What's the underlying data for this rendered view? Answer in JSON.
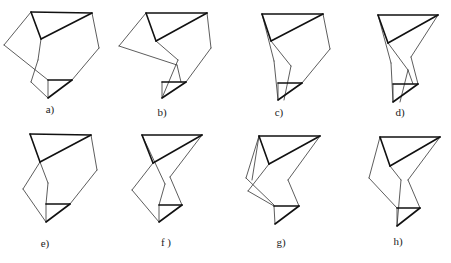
{
  "figure": {
    "panels": [
      {
        "id": "a",
        "label": "a)",
        "label_pos": [
          50,
          111
        ],
        "thick": [
          [
            31,
            12,
            92,
            13
          ],
          [
            31,
            12,
            41,
            39
          ],
          [
            41,
            39,
            92,
            13
          ],
          [
            48,
            80,
            72,
            80
          ],
          [
            48,
            98,
            72,
            80
          ]
        ],
        "thin": [
          [
            92,
            13,
            99,
            48
          ],
          [
            99,
            48,
            72,
            80
          ],
          [
            31,
            12,
            4,
            45
          ],
          [
            4,
            45,
            48,
            80
          ],
          [
            41,
            39,
            38,
            60
          ],
          [
            38,
            60,
            31,
            82
          ],
          [
            31,
            82,
            48,
            98
          ],
          [
            48,
            80,
            48,
            98
          ]
        ]
      },
      {
        "id": "b",
        "label": "b)",
        "label_pos": [
          162,
          114
        ],
        "thick": [
          [
            146,
            13,
            207,
            13
          ],
          [
            146,
            13,
            156,
            41
          ],
          [
            156,
            41,
            207,
            13
          ],
          [
            162,
            82,
            186,
            82
          ],
          [
            162,
            98,
            186,
            82
          ]
        ],
        "thin": [
          [
            207,
            13,
            211,
            48
          ],
          [
            211,
            48,
            186,
            82
          ],
          [
            146,
            13,
            119,
            46
          ],
          [
            119,
            46,
            177,
            65
          ],
          [
            156,
            41,
            178,
            60
          ],
          [
            178,
            60,
            162,
            98
          ],
          [
            162,
            82,
            162,
            98
          ],
          [
            177,
            65,
            181,
            82
          ]
        ]
      },
      {
        "id": "c",
        "label": "c)",
        "label_pos": [
          279,
          114
        ],
        "thick": [
          [
            262,
            14,
            323,
            14
          ],
          [
            262,
            14,
            271,
            41
          ],
          [
            271,
            41,
            323,
            14
          ],
          [
            278,
            83,
            302,
            83
          ],
          [
            278,
            100,
            302,
            83
          ]
        ],
        "thin": [
          [
            323,
            14,
            330,
            49
          ],
          [
            330,
            49,
            302,
            83
          ],
          [
            262,
            14,
            274,
            61
          ],
          [
            274,
            61,
            278,
            100
          ],
          [
            271,
            41,
            291,
            66
          ],
          [
            291,
            66,
            284,
            100
          ],
          [
            278,
            83,
            278,
            100
          ]
        ]
      },
      {
        "id": "d",
        "label": "d)",
        "label_pos": [
          400,
          114
        ],
        "thick": [
          [
            378,
            15,
            438,
            15
          ],
          [
            378,
            15,
            388,
            43
          ],
          [
            388,
            43,
            438,
            15
          ],
          [
            393,
            84,
            418,
            84
          ],
          [
            393,
            102,
            418,
            84
          ]
        ],
        "thin": [
          [
            438,
            15,
            411,
            57
          ],
          [
            411,
            57,
            418,
            84
          ],
          [
            378,
            15,
            391,
            63
          ],
          [
            391,
            63,
            393,
            102
          ],
          [
            388,
            43,
            408,
            70
          ],
          [
            408,
            70,
            400,
            102
          ],
          [
            393,
            84,
            393,
            102
          ],
          [
            408,
            70,
            413,
            84
          ]
        ]
      },
      {
        "id": "e",
        "label": "e)",
        "label_pos": [
          45,
          245
        ],
        "thick": [
          [
            30,
            134,
            91,
            135
          ],
          [
            30,
            134,
            40,
            162
          ],
          [
            40,
            162,
            91,
            135
          ],
          [
            46,
            204,
            70,
            204
          ],
          [
            46,
            222,
            70,
            204
          ]
        ],
        "thin": [
          [
            91,
            135,
            97,
            170
          ],
          [
            97,
            170,
            70,
            204
          ],
          [
            40,
            162,
            23,
            189
          ],
          [
            23,
            189,
            46,
            222
          ],
          [
            40,
            162,
            48,
            183
          ],
          [
            48,
            183,
            46,
            204
          ],
          [
            46,
            204,
            46,
            222
          ]
        ]
      },
      {
        "id": "f",
        "label": "f )",
        "label_pos": [
          166,
          244
        ],
        "thick": [
          [
            142,
            135,
            202,
            135
          ],
          [
            142,
            135,
            153,
            163
          ],
          [
            153,
            163,
            202,
            135
          ],
          [
            159,
            205,
            182,
            205
          ],
          [
            159,
            222,
            182,
            205
          ]
        ],
        "thin": [
          [
            202,
            135,
            170,
            177
          ],
          [
            170,
            177,
            182,
            205
          ],
          [
            153,
            163,
            132,
            190
          ],
          [
            132,
            190,
            159,
            222
          ],
          [
            142,
            135,
            165,
            184
          ],
          [
            165,
            184,
            159,
            205
          ],
          [
            159,
            205,
            159,
            222
          ]
        ]
      },
      {
        "id": "g",
        "label": "g)",
        "label_pos": [
          281,
          244
        ],
        "thick": [
          [
            259,
            136,
            320,
            136
          ],
          [
            259,
            136,
            269,
            164
          ],
          [
            269,
            164,
            320,
            136
          ],
          [
            274,
            206,
            299,
            206
          ],
          [
            275,
            224,
            299,
            206
          ]
        ],
        "thin": [
          [
            320,
            136,
            288,
            180
          ],
          [
            288,
            180,
            299,
            206
          ],
          [
            259,
            136,
            246,
            178
          ],
          [
            246,
            178,
            274,
            205
          ],
          [
            269,
            164,
            248,
            191
          ],
          [
            248,
            191,
            274,
            206
          ],
          [
            274,
            206,
            275,
            224
          ],
          [
            259,
            136,
            252,
            180
          ]
        ]
      },
      {
        "id": "h",
        "label": "h)",
        "label_pos": [
          398,
          243
        ],
        "thick": [
          [
            380,
            137,
            440,
            137
          ],
          [
            380,
            137,
            390,
            166
          ],
          [
            390,
            166,
            440,
            137
          ],
          [
            397,
            208,
            420,
            208
          ],
          [
            397,
            226,
            420,
            208
          ]
        ],
        "thin": [
          [
            440,
            137,
            408,
            180
          ],
          [
            408,
            180,
            420,
            208
          ],
          [
            380,
            137,
            369,
            178
          ],
          [
            369,
            178,
            397,
            208
          ],
          [
            390,
            166,
            401,
            180
          ],
          [
            401,
            180,
            397,
            226
          ],
          [
            397,
            208,
            397,
            226
          ]
        ]
      }
    ]
  }
}
